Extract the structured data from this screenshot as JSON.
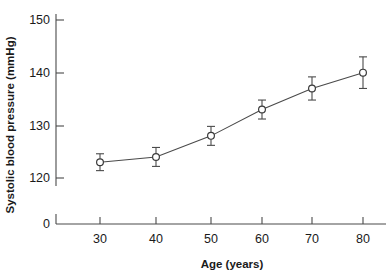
{
  "chart_data": {
    "type": "line",
    "title": "",
    "subtitle": "",
    "xlabel": "Age (years)",
    "ylabel": "Systolic blood pressure (mmHg)",
    "x": [
      30,
      40,
      50,
      60,
      70,
      80
    ],
    "categories": [
      "30",
      "40",
      "50",
      "60",
      "70",
      "80"
    ],
    "values": [
      123,
      124,
      128,
      133,
      137,
      140
    ],
    "series": [
      {
        "name": "Systolic blood pressure",
        "values": [
          123,
          124,
          128,
          133,
          137,
          140
        ],
        "errors": [
          1.6,
          1.8,
          1.8,
          1.8,
          2.2,
          3.0
        ]
      }
    ],
    "xtick_labels": [
      "30",
      "40",
      "50",
      "60",
      "70",
      "80"
    ],
    "ytick_labels": [
      "0",
      "120",
      "130",
      "140",
      "150"
    ],
    "ylim": [
      120,
      150
    ],
    "xlim": [
      25,
      85
    ],
    "y_axis_break": true,
    "y_axis_break_note": "axis broken between 0 and 120",
    "grid": false,
    "legend": false,
    "legend_position": "none",
    "marker": "open-circle",
    "error_bars": true,
    "line_color": "#4a4a4a",
    "marker_fill": "#ffffff",
    "marker_stroke": "#3a3a3a",
    "background": "#ffffff"
  },
  "axes": {
    "y_ticks": [
      {
        "label": "150",
        "y": 20
      },
      {
        "label": "140",
        "y": 73
      },
      {
        "label": "130",
        "y": 126
      },
      {
        "label": "120",
        "y": 178
      },
      {
        "label": "0",
        "y": 224
      }
    ],
    "x_ticks": [
      {
        "label": "30",
        "x": 100
      },
      {
        "label": "40",
        "x": 156
      },
      {
        "label": "50",
        "x": 211
      },
      {
        "label": "60",
        "x": 262
      },
      {
        "label": "70",
        "x": 312
      },
      {
        "label": "80",
        "x": 363
      }
    ]
  }
}
